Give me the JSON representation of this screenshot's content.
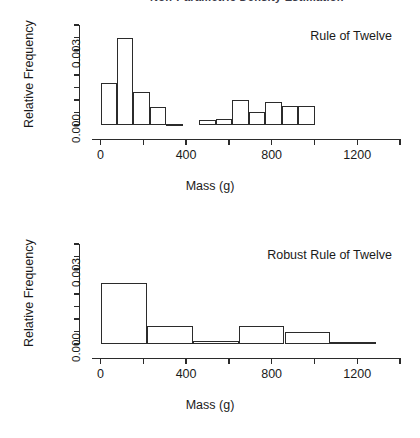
{
  "page": {
    "cropped_header_text": "Non-Parametric Density Estimation",
    "background_color": "#ffffff",
    "line_color": "#2b2b2b"
  },
  "chart_data": [
    {
      "type": "bar",
      "subtype": "histogram",
      "title": "Rule of Twelve",
      "xlabel": "Mass (g)",
      "ylabel": "Relative Frequency",
      "xlim": [
        -40,
        1400
      ],
      "ylim": [
        0,
        0.004
      ],
      "grid": false,
      "legend": "none",
      "xticks": [
        0,
        200,
        400,
        600,
        800,
        1000,
        1200,
        1400
      ],
      "xtick_labels": [
        "0",
        "",
        "400",
        "",
        "800",
        "",
        "1200",
        ""
      ],
      "yticks": [
        0.0,
        0.0005,
        0.001,
        0.0015,
        0.002,
        0.0025,
        0.003,
        0.0035,
        0.004
      ],
      "ytick_labels": [
        "0.000",
        "",
        "",
        "",
        "",
        "",
        "0.003",
        "",
        ""
      ],
      "bin_width": 77,
      "bin_edges": [
        0,
        77,
        154,
        231,
        308,
        385,
        462,
        539,
        616,
        693,
        770,
        847,
        924,
        1001,
        1078
      ],
      "values": [
        0.00168,
        0.00347,
        0.00133,
        0.00073,
        0.0,
        0.00022,
        0.00024,
        0.00102,
        0.00052,
        0.00091,
        0.00075,
        0.00077,
        0.0,
        0.0
      ],
      "bars": [
        {
          "x0": 0,
          "x1": 77,
          "height": 0.00168
        },
        {
          "x0": 77,
          "x1": 154,
          "height": 0.00347
        },
        {
          "x0": 154,
          "x1": 231,
          "height": 0.00133
        },
        {
          "x0": 231,
          "x1": 308,
          "height": 0.00073
        },
        {
          "x0": 308,
          "x1": 385,
          "height": 0.0
        },
        {
          "x0": 462,
          "x1": 539,
          "height": 0.00022
        },
        {
          "x0": 539,
          "x1": 616,
          "height": 0.00024
        },
        {
          "x0": 616,
          "x1": 693,
          "height": 0.00102
        },
        {
          "x0": 693,
          "x1": 770,
          "height": 0.00052
        },
        {
          "x0": 770,
          "x1": 847,
          "height": 0.00091
        },
        {
          "x0": 847,
          "x1": 924,
          "height": 0.00075
        },
        {
          "x0": 924,
          "x1": 1001,
          "height": 0.00077
        }
      ]
    },
    {
      "type": "bar",
      "subtype": "histogram",
      "title": "Robust Rule of Twelve",
      "xlabel": "Mass (g)",
      "ylabel": "Relative Frequency",
      "xlim": [
        -40,
        1400
      ],
      "ylim": [
        0,
        0.004
      ],
      "grid": false,
      "legend": "none",
      "xticks": [
        0,
        200,
        400,
        600,
        800,
        1000,
        1200,
        1400
      ],
      "xtick_labels": [
        "0",
        "",
        "400",
        "",
        "800",
        "",
        "1200",
        ""
      ],
      "yticks": [
        0.0,
        0.0005,
        0.001,
        0.0015,
        0.002,
        0.0025,
        0.003,
        0.0035,
        0.004
      ],
      "ytick_labels": [
        "0.000",
        "",
        "",
        "",
        "",
        "",
        "0.003",
        "",
        ""
      ],
      "bin_width": 215,
      "bin_edges": [
        0,
        215,
        430,
        645,
        860,
        1075,
        1290
      ],
      "values": [
        0.00245,
        0.00072,
        0.00012,
        0.00074,
        0.00048,
        9e-05
      ],
      "bars": [
        {
          "x0": 0,
          "x1": 215,
          "height": 0.00245
        },
        {
          "x0": 215,
          "x1": 430,
          "height": 0.00072
        },
        {
          "x0": 430,
          "x1": 645,
          "height": 0.00012
        },
        {
          "x0": 645,
          "x1": 860,
          "height": 0.00074
        },
        {
          "x0": 860,
          "x1": 1075,
          "height": 0.00048
        },
        {
          "x0": 1075,
          "x1": 1290,
          "height": 9e-05
        }
      ]
    }
  ]
}
